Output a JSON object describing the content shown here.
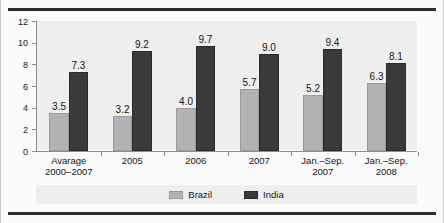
{
  "chart_data": {
    "type": "bar",
    "title": "",
    "subtitle": "",
    "xlabel": "",
    "ylabel": "",
    "ylim": [
      0,
      12
    ],
    "yticks": [
      "0",
      "2",
      "4",
      "6",
      "8",
      "10",
      "12"
    ],
    "grid": false,
    "legend_position": "bottom-center",
    "categories": [
      "Avarage\n2000–2007",
      "2005",
      "2006",
      "2007",
      "Jan.–Sep.\n2007",
      "Jan.–Sep.\n2008"
    ],
    "category_lines": [
      [
        "Avarage",
        "2000–2007"
      ],
      [
        "2005",
        ""
      ],
      [
        "2006",
        ""
      ],
      [
        "2007",
        ""
      ],
      [
        "Jan.–Sep.",
        "2007"
      ],
      [
        "Jan.–Sep.",
        "2008"
      ]
    ],
    "series": [
      {
        "name": "Brazil",
        "color": "#b3b3b3",
        "values": [
          3.5,
          3.2,
          4.0,
          5.7,
          5.2,
          6.3
        ],
        "labels": [
          "3.5",
          "3.2",
          "4.0",
          "5.7",
          "5.2",
          "6.3"
        ]
      },
      {
        "name": "India",
        "color": "#3a3a3a",
        "values": [
          7.3,
          9.2,
          9.7,
          9.0,
          9.4,
          8.1
        ],
        "labels": [
          "7.3",
          "9.2",
          "9.7",
          "9.0",
          "9.4",
          "8.1"
        ]
      }
    ]
  },
  "legend": {
    "items": [
      {
        "label": "Brazil"
      },
      {
        "label": "India"
      }
    ]
  }
}
